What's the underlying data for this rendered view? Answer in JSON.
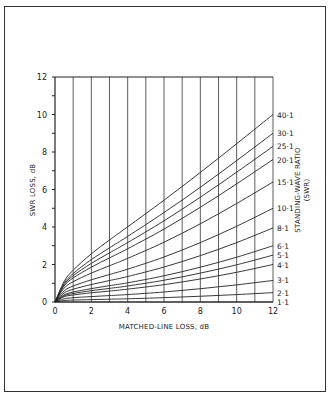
{
  "chart_data": {
    "type": "line",
    "title": "",
    "xlabel": "MATCHED-LINE LOSS, dB",
    "ylabel": "SWR LOSS, dB",
    "right_label": [
      "STANDING-WAVE RATIO",
      "(SWR)"
    ],
    "xlim": [
      0,
      12
    ],
    "ylim": [
      0,
      12
    ],
    "x_ticks": [
      0,
      2,
      4,
      6,
      8,
      10,
      12
    ],
    "x_tick_labels": [
      "0",
      "2",
      "4",
      "6",
      "8",
      "10",
      "12"
    ],
    "y_ticks": [
      0,
      2,
      4,
      6,
      8,
      10,
      12
    ],
    "y_tick_labels": [
      "0",
      "2",
      "4",
      "6",
      "8",
      "10",
      "12"
    ],
    "grid": "vertical lines every 1 dB",
    "legend": "curve labels at right end",
    "x": [
      0,
      0.5,
      1,
      2,
      3,
      4,
      6,
      8,
      10,
      12
    ],
    "series": [
      {
        "name": "40:1",
        "label": "40·1",
        "values": [
          0,
          1.26,
          1.96,
          2.97,
          3.82,
          4.63,
          6.27,
          7.98,
          9.75,
          11.55
        ]
      },
      {
        "name": "30:1",
        "label": "30·1",
        "values": [
          0,
          1.17,
          1.79,
          2.67,
          3.41,
          4.13,
          5.63,
          7.22,
          8.9,
          10.62
        ]
      },
      {
        "name": "25:1",
        "label": "25·1",
        "values": [
          0,
          1.1,
          1.68,
          2.47,
          3.14,
          3.8,
          5.19,
          6.7,
          8.3,
          9.95
        ]
      },
      {
        "name": "20:1",
        "label": "20·1",
        "values": [
          0,
          1.02,
          1.53,
          2.22,
          2.81,
          3.39,
          4.64,
          6.03,
          7.52,
          9.07
        ]
      },
      {
        "name": "15:1",
        "label": "15·1",
        "values": [
          0,
          0.9,
          1.32,
          1.88,
          2.36,
          2.84,
          3.89,
          5.09,
          6.41,
          7.81
        ]
      },
      {
        "name": "10:1",
        "label": "10·1",
        "values": [
          0,
          0.71,
          1.02,
          1.42,
          1.76,
          2.1,
          2.88,
          3.8,
          4.85,
          6.0
        ]
      },
      {
        "name": "8:1",
        "label": "8·1",
        "values": [
          0,
          0.61,
          0.86,
          1.18,
          1.45,
          1.72,
          2.36,
          3.13,
          4.01,
          5.0
        ]
      },
      {
        "name": "6:1",
        "label": "6·1",
        "values": [
          0,
          0.48,
          0.67,
          0.9,
          1.1,
          1.29,
          1.76,
          2.34,
          3.01,
          3.78
        ]
      },
      {
        "name": "5:1",
        "label": "5·1",
        "values": [
          0,
          0.41,
          0.56,
          0.75,
          0.9,
          1.06,
          1.44,
          1.91,
          2.46,
          3.1
        ]
      },
      {
        "name": "4:1",
        "label": "4·1",
        "values": [
          0,
          0.33,
          0.44,
          0.58,
          0.69,
          0.81,
          1.09,
          1.45,
          1.87,
          2.36
        ]
      },
      {
        "name": "3:1",
        "label": "3·1",
        "values": [
          0,
          0.22,
          0.3,
          0.38,
          0.45,
          0.52,
          0.7,
          0.93,
          1.2,
          1.51
        ]
      },
      {
        "name": "2:1",
        "label": "2·1",
        "values": [
          0,
          0.1,
          0.14,
          0.17,
          0.2,
          0.23,
          0.31,
          0.41,
          0.53,
          0.67
        ]
      },
      {
        "name": "1:1",
        "label": "1·1",
        "values": [
          0,
          0,
          0,
          0,
          0,
          0,
          0,
          0,
          0,
          0
        ]
      }
    ],
    "end_label_y": [
      10.0,
      9.0,
      8.3,
      7.6,
      6.4,
      5.0,
      3.95,
      3.0,
      2.5,
      2.0,
      1.15,
      0.5,
      0.0
    ]
  }
}
